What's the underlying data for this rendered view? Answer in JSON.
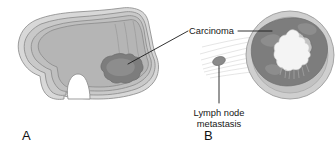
{
  "figure": {
    "background_color": "#ffffff"
  },
  "panels": [
    {
      "id": "A",
      "letter": "A",
      "description": "Sagittal cutaway of stomach showing carcinoma mass in the antrum / lesser curvature region"
    },
    {
      "id": "B",
      "letter": "B",
      "description": "Transverse cross-section of stomach wall showing circumferential carcinoma and irregular lumen, with adjacent lymph node metastasis"
    }
  ],
  "labels": {
    "carcinoma": "Carcinoma",
    "lymph_node_line1": "Lymph node",
    "lymph_node_line2": "metastasis"
  },
  "colors": {
    "background": "#ffffff",
    "serosa_outer": "#d6d6d6",
    "muscularis": "#c6c6c6",
    "submucosa": "#bdbdbd",
    "mucosa_lumen": "#b8b8b8",
    "tumor_dark": "#7d7d7d",
    "tumor_mid": "#8f8f8f",
    "ring_outer": "#cfcfcf",
    "ring_inner": "#c2c2c2",
    "lumen_white": "#f4f4f4",
    "lymph_node": "#8a8a8a",
    "outline": "#8d8d8d",
    "leader_line": "#1b1b1b",
    "text": "#161616",
    "lymphatic_fan": "#cfcfcf"
  },
  "annotations": {
    "carcinoma_leader_targets": [
      "panel-A-tumor",
      "panel-B-tumor-ring"
    ],
    "lymph_leader_target": "lymph-node-oval"
  }
}
